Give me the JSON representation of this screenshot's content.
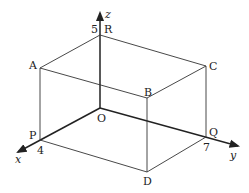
{
  "diagram": {
    "axes": {
      "x": {
        "label": "x",
        "tick_label": "4"
      },
      "y": {
        "label": "y",
        "tick_label": "7"
      },
      "z": {
        "label": "z",
        "tick_label": "5"
      }
    },
    "points": {
      "O": {
        "label": "O"
      },
      "P": {
        "label": "P"
      },
      "Q": {
        "label": "Q"
      },
      "R": {
        "label": "R"
      },
      "A": {
        "label": "A"
      },
      "B": {
        "label": "B"
      },
      "C": {
        "label": "C"
      },
      "D": {
        "label": "D"
      }
    },
    "colors": {
      "line": "#333333",
      "background": "#ffffff"
    }
  }
}
